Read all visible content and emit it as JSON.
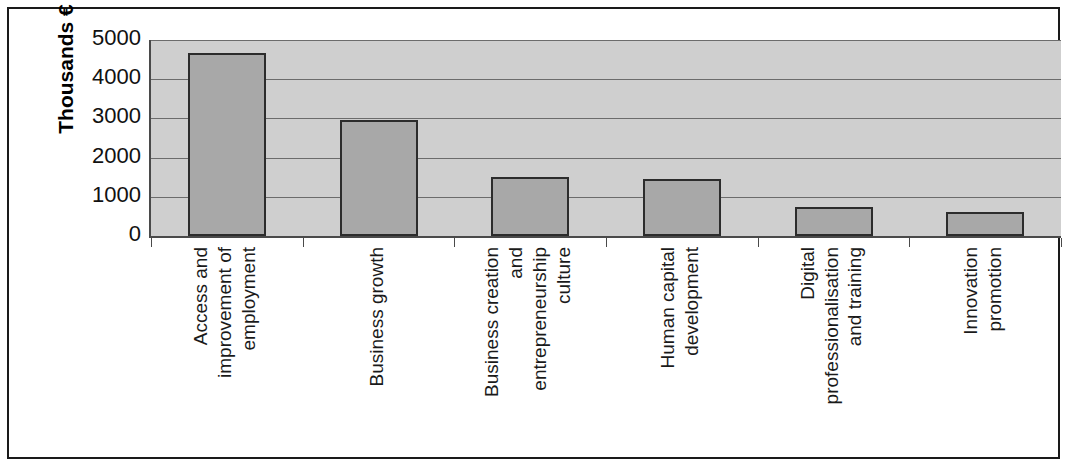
{
  "chart_data": {
    "type": "bar",
    "title": "",
    "subtitle": "",
    "xlabel": "",
    "ylabel": "Thousands €",
    "ylim": [
      0,
      5000
    ],
    "y_ticks": [
      5000,
      4000,
      3000,
      2000,
      1000,
      0
    ],
    "grid": true,
    "legend": "none",
    "categories": [
      "Access and improvement of employment",
      "Business growth",
      "Business creation and entrepreneurship culture",
      "Human capital development",
      "Digital professionalisation and training",
      "Innovation promotion"
    ],
    "category_lines": [
      [
        "Access and",
        "improvement of",
        "employment"
      ],
      [
        "Business growth"
      ],
      [
        "Business creation",
        "and",
        "entrepreneurship",
        "culture"
      ],
      [
        "Human capital",
        "development"
      ],
      [
        "Digital",
        "professionalisation",
        "and training"
      ],
      [
        "Innovation",
        "promotion"
      ]
    ],
    "values": [
      4670,
      2950,
      1500,
      1450,
      750,
      610
    ],
    "bar_color": "#a8a8a8",
    "bar_border_color": "#2c2c2c",
    "plot_background": "#cfcfcf",
    "gridline_color": "#6c6c6c",
    "axis_color": "#4a4a4a",
    "frame_color": "#1a1a1a"
  },
  "axis": {
    "y_title": "Thousands €",
    "y_tick_labels": [
      "5000",
      "4000",
      "3000",
      "2000",
      "1000",
      "0"
    ]
  }
}
